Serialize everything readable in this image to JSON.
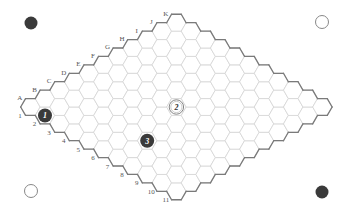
{
  "game": {
    "type": "Hex",
    "size": 11,
    "column_labels": [
      "A",
      "B",
      "C",
      "D",
      "E",
      "F",
      "G",
      "H",
      "I",
      "J",
      "K"
    ],
    "row_labels": [
      "1",
      "2",
      "3",
      "4",
      "5",
      "6",
      "7",
      "8",
      "9",
      "10",
      "11"
    ]
  },
  "colors": {
    "dark_stone": "#3a3a3a",
    "light_stone": "#ffffff",
    "light_stone_ring": "#777777",
    "border": "#7a7a7a",
    "grid": "#d4d4d4",
    "label": "#555555"
  },
  "corner_markers": [
    {
      "position": "top-left",
      "color": "dark",
      "x": 31,
      "y": 23
    },
    {
      "position": "top-right",
      "color": "light",
      "x": 322,
      "y": 22
    },
    {
      "position": "bottom-left",
      "color": "light",
      "x": 31,
      "y": 191
    },
    {
      "position": "bottom-right",
      "color": "dark",
      "x": 322,
      "y": 192
    }
  ],
  "moves": [
    {
      "number": "1",
      "color": "dark",
      "cell": "A2",
      "col": 0,
      "row": 1
    },
    {
      "number": "2",
      "color": "light",
      "cell": "F6",
      "col": 5,
      "row": 5
    },
    {
      "number": "3",
      "color": "dark",
      "cell": "C7",
      "col": 2,
      "row": 6
    }
  ]
}
